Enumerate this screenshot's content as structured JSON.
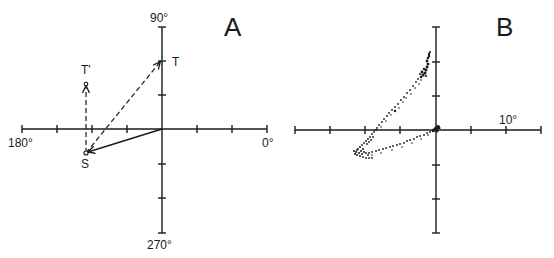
{
  "colors": {
    "ink": "#1a1a1a",
    "background": "#ffffff"
  },
  "panel_a": {
    "label": "A",
    "axis_labels": {
      "top": "90°",
      "left": "180°",
      "right": "0°",
      "bottom": "270°"
    },
    "points": [
      {
        "name": "T",
        "label": "T",
        "x": 161,
        "y": 61
      },
      {
        "name": "S",
        "label": "S",
        "x": 86,
        "y": 153
      },
      {
        "name": "T-prime",
        "label": "T'",
        "x": 86,
        "y": 85
      }
    ],
    "vectors": [
      {
        "from": "origin",
        "to": "S",
        "style": "solid"
      },
      {
        "from": "S",
        "to": "T",
        "style": "dashed"
      },
      {
        "from": "S",
        "to": "T-prime",
        "style": "dashed"
      }
    ]
  },
  "panel_b": {
    "label": "B",
    "axis_labels": {
      "scale": "10°"
    }
  }
}
